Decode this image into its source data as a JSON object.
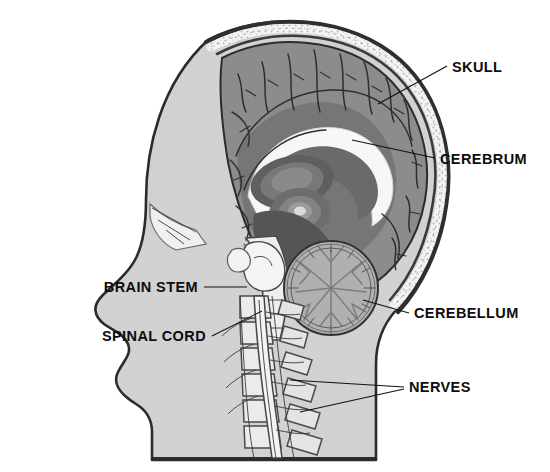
{
  "figure": {
    "orientation": "left-facing profile",
    "style": "grayscale medical illustration"
  },
  "palette": {
    "background": "#ffffff",
    "head_fill": "#d2d2d2",
    "skin_outline": "#2b2b2b",
    "skull_outer": "#3a3a3a",
    "skull_diploe": "#f2f2f2",
    "cerebrum_cortex": "#8c8c8c",
    "cerebrum_deep": "#6e6e6e",
    "corpus_callosum": "#f5f5f5",
    "thalamus": "#7a7a7a",
    "brainstem": "#eeeeee",
    "cerebellum_fill": "#b4b4b4",
    "cerebellum_arbor": "#fafafa",
    "vertebra_fill": "#e8e8e8",
    "label_text": "#0d0d0d",
    "leader_line": "#111111"
  },
  "labels": [
    {
      "id": "skull",
      "text": "SKULL",
      "text_x": 452,
      "text_y": 72,
      "anchor": "start",
      "leaders": [
        [
          [
            447,
            66
          ],
          [
            378,
            104
          ]
        ]
      ]
    },
    {
      "id": "cerebrum",
      "text": "CEREBRUM",
      "text_x": 440,
      "text_y": 164,
      "anchor": "start",
      "leaders": [
        [
          [
            435,
            158
          ],
          [
            352,
            140
          ]
        ]
      ]
    },
    {
      "id": "brain-stem",
      "text": "BRAIN STEM",
      "text_x": 198,
      "text_y": 292,
      "anchor": "end",
      "leaders": [
        [
          [
            204,
            287
          ],
          [
            247,
            287
          ]
        ]
      ]
    },
    {
      "id": "spinal-cord",
      "text": "SPINAL CORD",
      "text_x": 206,
      "text_y": 341,
      "anchor": "end",
      "leaders": [
        [
          [
            212,
            336
          ],
          [
            262,
            311
          ]
        ]
      ]
    },
    {
      "id": "cerebellum",
      "text": "CEREBELLUM",
      "text_x": 414,
      "text_y": 318,
      "anchor": "start",
      "leaders": [
        [
          [
            409,
            313
          ],
          [
            363,
            300
          ]
        ]
      ]
    },
    {
      "id": "nerves",
      "text": "NERVES",
      "text_x": 409,
      "text_y": 392,
      "anchor": "start",
      "leaders": [
        [
          [
            404,
            387
          ],
          [
            290,
            380
          ]
        ],
        [
          [
            404,
            389
          ],
          [
            300,
            412
          ]
        ]
      ]
    }
  ],
  "structures": [
    {
      "name": "skull",
      "description": "cranial vault with outer table, speckled diploe and inner table"
    },
    {
      "name": "cerebrum",
      "description": "large convoluted cortex with gyri and sulci filling the cranial vault"
    },
    {
      "name": "corpus-callosum",
      "description": "bright white arched band in the centre of the brain"
    },
    {
      "name": "thalamus",
      "description": "concentric oval nuclei below the corpus callosum"
    },
    {
      "name": "brain-stem",
      "description": "midbrain, pons and medulla continuing down to the spinal cord"
    },
    {
      "name": "cerebellum",
      "description": "round structure with arbor vitae branching pattern, posterior-inferior to cerebrum"
    },
    {
      "name": "spinal-cord",
      "description": "cord running inside the cervical vertebral canal"
    },
    {
      "name": "nerves",
      "description": "spinal nerve roots emerging between the vertebrae"
    },
    {
      "name": "vertebrae",
      "description": "stack of cervical and upper thoracic vertebral bodies and spinous processes"
    },
    {
      "name": "face-profile",
      "description": "forehead, nose, lips, chin and neck silhouette facing left"
    }
  ]
}
